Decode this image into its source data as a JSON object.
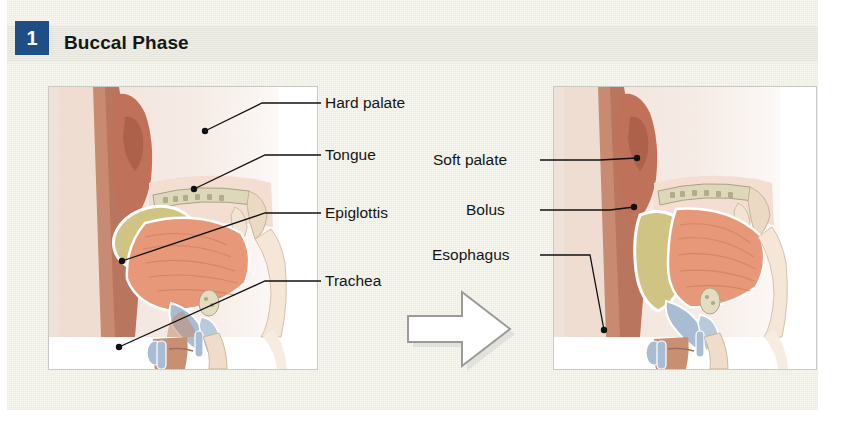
{
  "header": {
    "step_number": "1",
    "phase_title": "Buccal Phase"
  },
  "colors": {
    "badge_blue": "#1f4e87",
    "page_cream": "#f7f7ef",
    "band_gray": "#eeeee6",
    "skin_pale": "#f2dcd0",
    "skin_mid": "#e8b79b",
    "lip_rose": "#c0705a",
    "tongue_salmon": "#e79878",
    "bolus_khaki": "#cfc484",
    "cartilage_blue": "#a8bdd4",
    "bone_cream": "#ded8bb",
    "leader_black": "#111111",
    "arrow_outline": "#9a9a9a",
    "frame_border": "#c9c9c4"
  },
  "left_figure": {
    "name": "buccal-phase-before",
    "labels": [
      {
        "id": "hard-palate",
        "text": "Hard palate",
        "x": 325,
        "y": 103
      },
      {
        "id": "tongue",
        "text": "Tongue",
        "x": 325,
        "y": 155
      },
      {
        "id": "epiglottis",
        "text": "Epiglottis",
        "x": 325,
        "y": 213
      },
      {
        "id": "trachea",
        "text": "Trachea",
        "x": 325,
        "y": 281
      }
    ]
  },
  "right_figure": {
    "name": "buccal-phase-after",
    "labels": [
      {
        "id": "soft-palate",
        "text": "Soft palate",
        "x": 433,
        "y": 160
      },
      {
        "id": "bolus",
        "text": "Bolus",
        "x": 466,
        "y": 210
      },
      {
        "id": "esophagus",
        "text": "Esophagus",
        "x": 432,
        "y": 255
      }
    ]
  },
  "transition": {
    "arrow_name": "rightward-transition-arrow",
    "direction": "right"
  },
  "leader_lines": {
    "left": [
      {
        "id": "hard-palate",
        "path": "M 321 103 L 262 103 L 205 131",
        "dot": [
          205,
          131
        ]
      },
      {
        "id": "tongue",
        "path": "M 321 155 L 265 155 L 194 189",
        "dot": [
          194,
          189
        ]
      },
      {
        "id": "epiglottis",
        "path": "M 321 213 L 265 213 L 122 261",
        "dot": [
          122,
          261
        ]
      },
      {
        "id": "trachea",
        "path": "M 321 281 L 265 281 L 119 347",
        "dot": [
          119,
          347
        ]
      }
    ],
    "right": [
      {
        "id": "soft-palate",
        "path": "M 540 160 L 600 160 L 637 158",
        "dot": [
          637,
          158
        ]
      },
      {
        "id": "bolus",
        "path": "M 540 210 L 610 210 L 634 207",
        "dot": [
          634,
          207
        ]
      },
      {
        "id": "esophagus",
        "path": "M 540 255 L 590 255 L 604 330",
        "dot": [
          604,
          330
        ]
      }
    ]
  }
}
